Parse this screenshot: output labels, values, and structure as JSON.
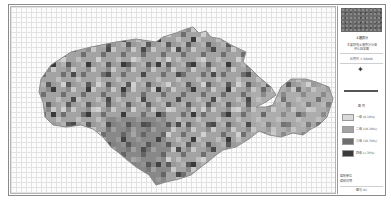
{
  "map": {
    "type": "grid thematic map",
    "grid": "on",
    "colors": {
      "background": "#fcfcfc",
      "grid_line": "#e2e2e2",
      "outline": "#8c8c8c"
    }
  },
  "panel": {
    "title": "土壤养分",
    "subtitle_line1": "主要耕地土壤养分分级",
    "subtitle_line2": "评价结果图",
    "legend_heading": "图 例",
    "scale_text": "比例尺 1:50000",
    "legend": [
      {
        "label": "一级 (0-10%)",
        "color": "#d9d9d9"
      },
      {
        "label": "二级 (10-30%)",
        "color": "#a3a3a3"
      },
      {
        "label": "三级 (30-70%)",
        "color": "#6e6e6e"
      },
      {
        "label": "四级 (>70%)",
        "color": "#3a3a3a"
      }
    ],
    "footer_line1": "编制单位",
    "footer_line2": "编制日期",
    "footer_bottom": "图号 01"
  }
}
